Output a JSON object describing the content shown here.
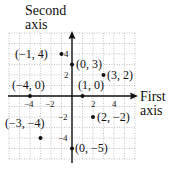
{
  "chart_data": {
    "type": "scatter",
    "title": "",
    "xlabel": "First axis",
    "ylabel": "Second axis",
    "xlim": [
      -6,
      6
    ],
    "ylim": [
      -6,
      6
    ],
    "grid": true,
    "x_ticks": [
      -4,
      -2,
      2,
      4
    ],
    "y_ticks": [
      4,
      2,
      -2,
      -4
    ],
    "points": [
      {
        "x": -1,
        "y": 4,
        "label": "(−1, 4)"
      },
      {
        "x": 0,
        "y": 3,
        "label": "(0, 3)"
      },
      {
        "x": 3,
        "y": 2,
        "label": "(3, 2)"
      },
      {
        "x": -4,
        "y": 0,
        "label": "(−4, 0)"
      },
      {
        "x": 1,
        "y": 0,
        "label": "(1, 0)"
      },
      {
        "x": 2,
        "y": -2,
        "label": "(2, −2)"
      },
      {
        "x": -3,
        "y": -4,
        "label": "(−3, −4)"
      },
      {
        "x": 0,
        "y": -5,
        "label": "(0, −5)"
      }
    ]
  },
  "labels": {
    "y_axis_line1": "Second",
    "y_axis_line2": "axis",
    "x_axis_line1": "First",
    "x_axis_line2": "axis",
    "tick_x_m4": "−4",
    "tick_x_m2": "−2",
    "tick_x_2": "2",
    "tick_x_4": "4",
    "tick_y_4": "4",
    "tick_y_2": "2",
    "tick_y_m2": "−2",
    "tick_y_m4": "−4",
    "p1": "(−1, 4)",
    "p2": "(0, 3)",
    "p3": "(3, 2)",
    "p4": "(−4, 0)",
    "p5": "(1, 0)",
    "p6": "(2, −2)",
    "p7": "(−3, −4)",
    "p8": "(0, −5)"
  }
}
